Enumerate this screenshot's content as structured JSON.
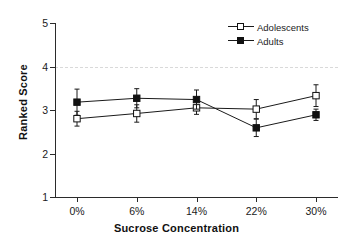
{
  "chart_data": {
    "type": "line",
    "title": "",
    "xlabel": "Sucrose Concentration",
    "ylabel": "Ranked Score",
    "categories": [
      "0%",
      "6%",
      "14%",
      "22%",
      "30%"
    ],
    "ylim": [
      1,
      5
    ],
    "yticks": [
      1,
      2,
      3,
      4,
      5
    ],
    "ytick_labels": [
      "1",
      "2",
      "3",
      "4",
      "5"
    ],
    "grid": "dashed horizontal gridline at y = 4 only",
    "legend_position": "top-right inside plot",
    "series": [
      {
        "name": "Adolescents",
        "marker": "open-square",
        "values": [
          2.8,
          2.92,
          3.05,
          3.02,
          3.33
        ],
        "errors": [
          0.17,
          0.2,
          0.15,
          0.22,
          0.25
        ]
      },
      {
        "name": "Adults",
        "marker": "filled-square",
        "values": [
          3.18,
          3.27,
          3.24,
          2.59,
          2.89
        ],
        "errors": [
          0.3,
          0.22,
          0.22,
          0.2,
          0.13
        ]
      }
    ]
  },
  "axes": {
    "x_title": "Sucrose Concentration",
    "y_title": "Ranked Score",
    "x_tick_labels": [
      "0%",
      "6%",
      "14%",
      "22%",
      "30%"
    ],
    "y_tick_labels": [
      "5",
      "4",
      "3",
      "2",
      "1"
    ]
  },
  "legend": {
    "entries": [
      {
        "label": "Adolescents",
        "marker": "open-square"
      },
      {
        "label": "Adults",
        "marker": "filled-square"
      }
    ]
  },
  "colors": {
    "line": "#1a1a1a",
    "axis": "#2b2b2b",
    "gridline": "#d9d9d9",
    "marker_fill_open": "#ffffff",
    "marker_fill_closed": "#111111",
    "background": "#ffffff"
  }
}
